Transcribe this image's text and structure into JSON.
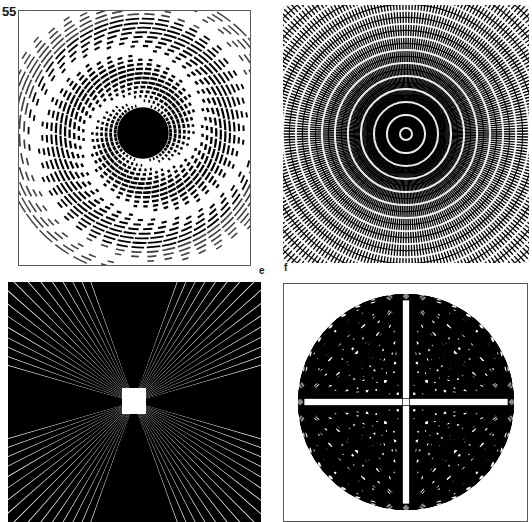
{
  "page": {
    "number": "55",
    "background_color": "#ffffff",
    "ink_color": "#000000",
    "border_color": "#595959",
    "width": 532,
    "height": 522
  },
  "labels": {
    "e": "e",
    "f": "f"
  },
  "figures": [
    {
      "id": "panel-e",
      "caption_letter": "e",
      "title": "Concentric broken-ring moire disc",
      "kind": "concentric-rings",
      "bordered": true,
      "center": {
        "x": 125,
        "y": 123
      },
      "ring_count": 26,
      "ring_spacing": 4.6,
      "inner_solid_radius": 26,
      "dash_sectors": 44,
      "stroke": "#000000",
      "bounds": {
        "x": 18,
        "y": 10,
        "w": 233,
        "h": 256
      }
    },
    {
      "id": "panel-f",
      "caption_letter": "f",
      "title": "Dense radial-line and ring interference field",
      "kind": "radial-moire",
      "bordered": false,
      "center": {
        "x": 123,
        "y": 129
      },
      "radial_line_count": 260,
      "ring_count": 30,
      "ring_spacing": 4.2,
      "stroke": "#000000",
      "bounds": {
        "x": 283,
        "y": 5,
        "w": 246,
        "h": 258
      }
    },
    {
      "id": "panel-g",
      "caption_letter": "",
      "title": "Radiating starburst from central white square",
      "kind": "starburst-square",
      "bordered": false,
      "center": {
        "x": 126,
        "y": 120
      },
      "ray_count": 100,
      "square": {
        "x": 114,
        "y": 106,
        "w": 24,
        "h": 26,
        "fill": "#ffffff"
      },
      "fill": "#000000",
      "bounds": {
        "x": 8,
        "y": 282,
        "w": 253,
        "h": 240
      }
    },
    {
      "id": "panel-h",
      "caption_letter": "",
      "title": "Four-focus radiating disc forming a white cross",
      "kind": "four-focus-disc",
      "bordered": true,
      "center": {
        "x": 122,
        "y": 118
      },
      "radius": 108,
      "focus_points": [
        "top",
        "right",
        "bottom",
        "left"
      ],
      "rays_per_focus": 40,
      "fill": "#000000",
      "bounds": {
        "x": 283,
        "y": 283,
        "w": 245,
        "h": 239
      }
    }
  ]
}
